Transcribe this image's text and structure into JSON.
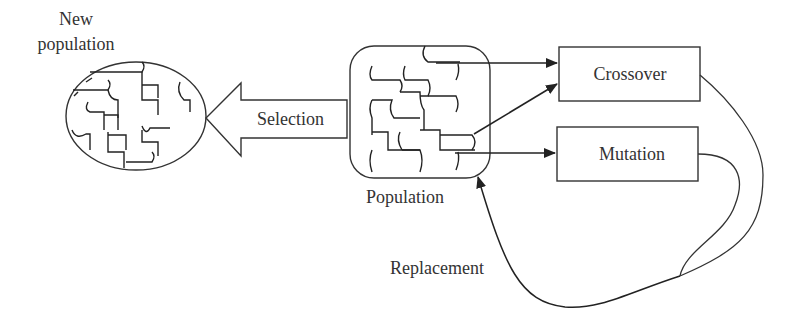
{
  "diagram": {
    "nodes": {
      "new_population": {
        "label_line1": "New",
        "label_line2": "population"
      },
      "population": {
        "label": "Population"
      },
      "crossover": {
        "label": "Crossover"
      },
      "mutation": {
        "label": "Mutation"
      }
    },
    "edges": {
      "selection": {
        "label": "Selection",
        "from": "population",
        "to": "new_population"
      },
      "to_crossover_1": {
        "from": "population",
        "to": "crossover"
      },
      "to_crossover_2": {
        "from": "population",
        "to": "crossover"
      },
      "to_mutation": {
        "from": "population",
        "to": "mutation"
      },
      "replacement": {
        "label": "Replacement",
        "from": [
          "crossover",
          "mutation"
        ],
        "to": "population"
      }
    },
    "colors": {
      "stroke": "#333333",
      "text": "#333333",
      "background": "#ffffff"
    }
  }
}
